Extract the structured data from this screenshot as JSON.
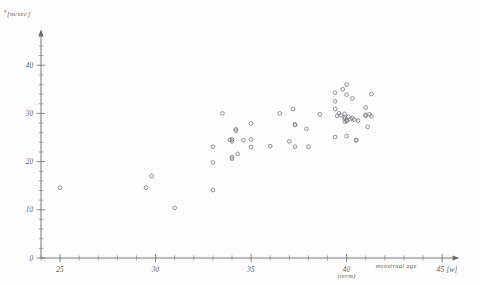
{
  "figure": {
    "kind": "scatter-plot",
    "background_color": "#fdfdfd",
    "ink_color": "#6a6a6a",
    "marker_color": "#7d7d84"
  },
  "labels": {
    "y_axis_symbol": "v",
    "y_axis_unit": "[m/sec]",
    "x_axis_name": "menstrual age",
    "x_axis_unit": "45 [w]",
    "term_annotation": "(term)"
  },
  "chart_data": {
    "type": "scatter",
    "title": "",
    "xlabel": "menstrual age [w]",
    "ylabel": "v [m/sec]",
    "xlim": [
      24,
      45.6
    ],
    "ylim": [
      0,
      46
    ],
    "grid": false,
    "legend": null,
    "x_ticks_major": [
      25,
      30,
      35,
      40,
      45
    ],
    "x_ticks_major_labels": [
      "25",
      "30",
      "35",
      "40",
      "45 [w]"
    ],
    "x_tick_minor_step": 1,
    "y_ticks_major": [
      0,
      10,
      20,
      30,
      40
    ],
    "y_ticks_major_labels": [
      "0",
      "10",
      "20",
      "30",
      "40"
    ],
    "y_tick_minor_step": 2,
    "annotations": [
      {
        "text": "(term)",
        "x": 40,
        "y": -4.2
      },
      {
        "text": "menstrual age",
        "x": 42.6,
        "y": -2.1
      }
    ],
    "marker": "open-circle",
    "n_points": 62,
    "points": [
      [
        25.0,
        14.6
      ],
      [
        29.5,
        14.6
      ],
      [
        29.8,
        17.0
      ],
      [
        31.0,
        10.4
      ],
      [
        33.0,
        23.1
      ],
      [
        33.0,
        19.8
      ],
      [
        33.0,
        14.1
      ],
      [
        33.5,
        30.0
      ],
      [
        34.0,
        24.6
      ],
      [
        34.0,
        24.2
      ],
      [
        34.0,
        20.9
      ],
      [
        34.0,
        20.6
      ],
      [
        34.2,
        26.7
      ],
      [
        34.2,
        26.4
      ],
      [
        34.3,
        21.6
      ],
      [
        35.0,
        27.9
      ],
      [
        35.0,
        24.6
      ],
      [
        35.0,
        23.0
      ],
      [
        36.0,
        23.2
      ],
      [
        36.5,
        30.0
      ],
      [
        37.0,
        24.2
      ],
      [
        37.2,
        30.9
      ],
      [
        37.3,
        27.7
      ],
      [
        37.3,
        27.6
      ],
      [
        37.3,
        23.1
      ],
      [
        37.9,
        26.8
      ],
      [
        38.0,
        23.1
      ],
      [
        38.6,
        29.8
      ],
      [
        39.4,
        34.3
      ],
      [
        39.4,
        32.5
      ],
      [
        39.4,
        30.9
      ],
      [
        39.4,
        25.1
      ],
      [
        39.8,
        35.0
      ],
      [
        39.9,
        29.2
      ],
      [
        39.9,
        28.9
      ],
      [
        39.9,
        28.3
      ],
      [
        40.0,
        36.0
      ],
      [
        40.0,
        33.9
      ],
      [
        40.0,
        28.6
      ],
      [
        40.0,
        28.4
      ],
      [
        40.0,
        25.3
      ],
      [
        40.3,
        33.1
      ],
      [
        40.3,
        29.0
      ],
      [
        40.5,
        24.5
      ],
      [
        40.5,
        24.4
      ],
      [
        41.0,
        31.2
      ],
      [
        41.0,
        29.7
      ],
      [
        41.0,
        29.5
      ],
      [
        41.1,
        27.2
      ],
      [
        41.3,
        34.0
      ],
      [
        41.3,
        29.4
      ],
      [
        33.9,
        24.5
      ],
      [
        34.6,
        24.4
      ],
      [
        39.6,
        30.0
      ],
      [
        39.7,
        29.6
      ],
      [
        40.1,
        29.3
      ],
      [
        40.2,
        28.8
      ],
      [
        41.2,
        29.8
      ],
      [
        39.5,
        29.5
      ],
      [
        40.4,
        28.7
      ],
      [
        39.9,
        29.9
      ],
      [
        40.6,
        28.5
      ]
    ]
  }
}
